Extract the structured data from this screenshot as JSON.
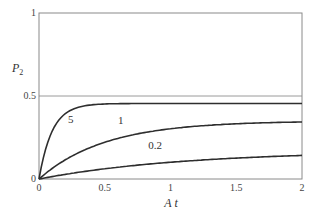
{
  "chart_data": {
    "type": "line",
    "title": "",
    "xlabel": "A t",
    "ylabel": "P2",
    "ylabel_main": "P",
    "ylabel_sub": "2",
    "xlim": [
      0,
      2
    ],
    "ylim": [
      0,
      1
    ],
    "grid": false,
    "reference_lines": [
      {
        "axis": "y",
        "value": 0.5
      }
    ],
    "x_ticks": [
      {
        "value": 0,
        "label": "0"
      },
      {
        "value": 0.5,
        "label": "0.5"
      },
      {
        "value": 1,
        "label": "1"
      },
      {
        "value": 1.5,
        "label": "1.5"
      },
      {
        "value": 2,
        "label": "2"
      }
    ],
    "y_ticks": [
      {
        "value": 0,
        "label": "0"
      },
      {
        "value": 0.5,
        "label": "0.5"
      },
      {
        "value": 1,
        "label": "1"
      }
    ],
    "series": [
      {
        "name": "5",
        "label": "5",
        "plateau": 0.455,
        "rate": 10,
        "x": [
          0,
          0.1,
          0.2,
          0.3,
          0.4,
          0.5,
          1.0,
          1.5,
          2.0
        ],
        "values": [
          0,
          0.29,
          0.39,
          0.43,
          0.447,
          0.452,
          0.455,
          0.455,
          0.455
        ],
        "label_pos": {
          "x": 0.22,
          "y": 0.34
        }
      },
      {
        "name": "1",
        "label": "1",
        "plateau": 0.35,
        "rate": 2,
        "x": [
          0,
          0.25,
          0.5,
          0.75,
          1.0,
          1.25,
          1.5,
          1.75,
          2.0
        ],
        "values": [
          0,
          0.138,
          0.221,
          0.272,
          0.303,
          0.321,
          0.333,
          0.339,
          0.344
        ],
        "label_pos": {
          "x": 0.6,
          "y": 0.33
        }
      },
      {
        "name": "0.2",
        "label": "0.2",
        "plateau": 0.17,
        "rate": 0.9,
        "x": [
          0,
          0.25,
          0.5,
          0.75,
          1.0,
          1.25,
          1.5,
          1.75,
          2.0
        ],
        "values": [
          0,
          0.034,
          0.061,
          0.083,
          0.101,
          0.114,
          0.126,
          0.135,
          0.142
        ],
        "label_pos": {
          "x": 0.83,
          "y": 0.18
        }
      }
    ],
    "legend": "inline curve labels"
  },
  "colors": {
    "axis": "#8a8a8a",
    "curve": "#2e2e2e",
    "reference_line": "#9a9a9a",
    "text": "#444444"
  },
  "layout": {
    "plot_left": 39,
    "plot_right": 302,
    "plot_top": 13,
    "plot_bottom": 179
  }
}
